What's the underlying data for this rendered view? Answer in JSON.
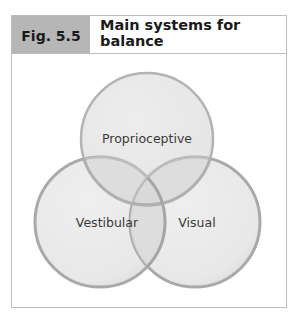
{
  "figure": {
    "number_label": "Fig. 5.5"
  },
  "diagram": {
    "type": "venn",
    "sets": [
      {
        "id": "proprioceptive",
        "label": "Proprioceptive"
      },
      {
        "id": "vestibular",
        "label": "Vestibular"
      },
      {
        "id": "visual",
        "label": "Visual"
      }
    ],
    "colors": {
      "fill": "#e9e9e9",
      "stroke": "#a9a9a9",
      "overlap": "#d6d6d6",
      "frame": "#bdbdbd",
      "header_box": "#b6b6b6",
      "text": "#3a3a3a"
    }
  }
}
